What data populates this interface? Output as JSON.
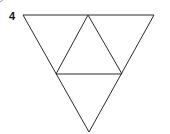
{
  "problem": {
    "number": "4"
  },
  "diagram": {
    "type": "triangle-net",
    "stroke_color": "#2a2a2a",
    "stroke_width": 1,
    "vertices": {
      "top_left": [
        23,
        15
      ],
      "top_mid": [
        88,
        15
      ],
      "top_right": [
        154,
        15
      ],
      "mid_left": [
        56,
        74
      ],
      "mid_right": [
        122,
        74
      ],
      "bottom": [
        89,
        132
      ]
    }
  }
}
